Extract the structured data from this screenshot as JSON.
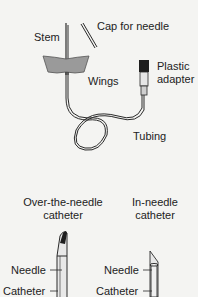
{
  "butterfly": {
    "labels": {
      "cap": "Cap for needle",
      "stem": "Stem",
      "wings": "Wings",
      "adapter_line1": "Plastic",
      "adapter_line2": "adapter",
      "tubing": "Tubing"
    }
  },
  "catheters": {
    "over_the_needle": {
      "title_line1": "Over-the-needle",
      "title_line2": "catheter",
      "needle_label": "Needle",
      "catheter_label": "Catheter"
    },
    "in_needle": {
      "title_line1": "In-needle",
      "title_line2": "catheter",
      "needle_label": "Needle",
      "catheter_label": "Catheter"
    }
  },
  "colors": {
    "background": "#f4f4f2",
    "line": "#2a2a2a",
    "wing_fill": "#9a9a9a",
    "adapter_dark": "#1e1e1e"
  }
}
